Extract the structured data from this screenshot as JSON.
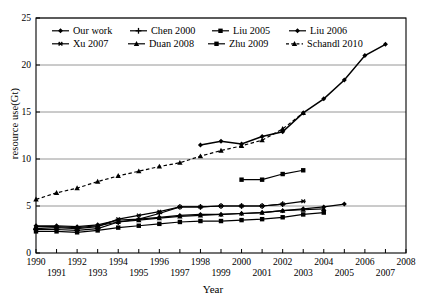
{
  "chart_data": {
    "type": "line",
    "title": "",
    "xlabel": "Year",
    "ylabel": "resource use(Gt)",
    "xlim": [
      1990,
      2008
    ],
    "ylim": [
      0,
      25
    ],
    "grid": true,
    "legend_position": "top-inside",
    "xticks": [
      1990,
      1991,
      1992,
      1993,
      1994,
      1995,
      1996,
      1997,
      1998,
      1999,
      2000,
      2001,
      2002,
      2003,
      2004,
      2005,
      2006,
      2007,
      2008
    ],
    "yticks": [
      0,
      5,
      10,
      15,
      20,
      25
    ],
    "series": [
      {
        "name": "Our work",
        "marker": "diamond",
        "linestyle": "solid",
        "color": "#000000",
        "x": [
          1998,
          1999,
          2000,
          2001,
          2002,
          2003,
          2004,
          2005,
          2006,
          2007
        ],
        "y": [
          11.5,
          11.9,
          11.6,
          12.4,
          12.9,
          14.9,
          16.4,
          18.4,
          21.0,
          22.2
        ]
      },
      {
        "name": "Chen 2000",
        "marker": "plus",
        "linestyle": "solid",
        "color": "#000000",
        "x": [
          1990,
          1991,
          1992,
          1993,
          1994,
          1995,
          1996,
          1997,
          1998,
          1999,
          2000,
          2001,
          2002
        ],
        "y": [
          2.5,
          2.5,
          2.4,
          2.6,
          3.3,
          3.6,
          4.2,
          4.9,
          4.9,
          5.0,
          5.0,
          5.0,
          5.2
        ]
      },
      {
        "name": "Liu 2005",
        "marker": "square",
        "linestyle": "solid",
        "color": "#000000",
        "x": [
          2000,
          2001,
          2002,
          2003
        ],
        "y": [
          7.8,
          7.8,
          8.4,
          8.8
        ]
      },
      {
        "name": "Liu 2006",
        "marker": "diamond",
        "linestyle": "solid",
        "color": "#000000",
        "x": [
          1990,
          1991,
          1992,
          1993,
          1994,
          1995,
          1996,
          1997,
          1998,
          1999,
          2000,
          2001,
          2002,
          2003,
          2004,
          2005
        ],
        "y": [
          2.9,
          2.9,
          2.8,
          3.0,
          3.5,
          3.6,
          3.8,
          4.0,
          4.1,
          4.1,
          4.2,
          4.3,
          4.5,
          4.7,
          4.9,
          5.2
        ]
      },
      {
        "name": "Xu 2007",
        "marker": "star",
        "linestyle": "solid",
        "color": "#000000",
        "x": [
          1990,
          1991,
          1992,
          1993,
          1994,
          1995,
          1996,
          1997,
          1998,
          1999,
          2000,
          2001,
          2002,
          2003
        ],
        "y": [
          2.6,
          2.7,
          2.6,
          2.8,
          3.6,
          4.0,
          4.4,
          4.9,
          4.9,
          5.0,
          5.0,
          5.0,
          5.2,
          5.5
        ]
      },
      {
        "name": "Duan 2008",
        "marker": "triangle",
        "linestyle": "solid",
        "color": "#000000",
        "x": [
          1990,
          1991,
          1992,
          1993,
          1994,
          1995,
          1996,
          1997,
          1998,
          1999,
          2000,
          2001,
          2002,
          2003,
          2004
        ],
        "y": [
          2.8,
          2.8,
          2.7,
          2.9,
          3.3,
          3.5,
          3.7,
          3.9,
          4.0,
          4.1,
          4.2,
          4.3,
          4.5,
          4.6,
          4.7
        ]
      },
      {
        "name": "Zhu 2009",
        "marker": "square",
        "linestyle": "solid",
        "color": "#000000",
        "x": [
          1990,
          1991,
          1992,
          1993,
          1994,
          1995,
          1996,
          1997,
          1998,
          1999,
          2000,
          2001,
          2002,
          2003,
          2004
        ],
        "y": [
          2.3,
          2.3,
          2.2,
          2.4,
          2.7,
          2.9,
          3.1,
          3.3,
          3.4,
          3.4,
          3.5,
          3.6,
          3.8,
          4.1,
          4.3
        ]
      },
      {
        "name": "Schandl 2010",
        "marker": "triangle",
        "linestyle": "dashed",
        "color": "#000000",
        "x": [
          1990,
          1991,
          1992,
          1993,
          1994,
          1995,
          1996,
          1997,
          1998,
          1999,
          2000,
          2001,
          2002,
          2003
        ],
        "y": [
          5.7,
          6.4,
          6.9,
          7.6,
          8.2,
          8.7,
          9.2,
          9.6,
          10.3,
          10.9,
          11.4,
          12.0,
          13.2,
          14.9
        ]
      }
    ]
  },
  "legend": {
    "entries": [
      {
        "label": "Our work"
      },
      {
        "label": "Chen 2000"
      },
      {
        "label": "Liu 2005"
      },
      {
        "label": "Liu 2006"
      },
      {
        "label": "Xu 2007"
      },
      {
        "label": "Duan 2008"
      },
      {
        "label": "Zhu 2009"
      },
      {
        "label": "Schandl 2010"
      }
    ]
  },
  "axes": {
    "x_title": "Year",
    "y_title": "resource use(Gt)"
  }
}
